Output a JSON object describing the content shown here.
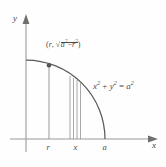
{
  "figure": {
    "type": "math-diagram",
    "background_color": "#fefefe",
    "stroke_color": "#4a4a4a",
    "axes": {
      "x_axis_label": "x",
      "y_axis_label": "y",
      "origin": {
        "x": 26,
        "y": 139
      }
    },
    "curve": {
      "equation_parts": {
        "x_var": "x",
        "y_var": "y",
        "a_var": "a",
        "exponent": "2",
        "plus": "+",
        "equals": "="
      },
      "equation_text": "x2 + y2 = a2",
      "radius_label": "a",
      "arc_start": {
        "x": 26,
        "y": 61
      },
      "arc_end": {
        "x": 105,
        "y": 139
      }
    },
    "point": {
      "marker": "filled-dot",
      "position": {
        "x": 49,
        "y": 65
      },
      "label_parts": {
        "open_paren": "(",
        "first_coord": "r",
        "comma": ",",
        "radical_symbol": "√",
        "under_a": "a",
        "minus": "−",
        "under_r": "r",
        "exponent": "2",
        "close_paren": ")"
      },
      "label_text": "(r, √(a2 − r2))"
    },
    "ticks": [
      {
        "label": "r",
        "x": 49
      },
      {
        "label": "x",
        "x": 76
      },
      {
        "label": "a",
        "x": 105
      }
    ],
    "strip": {
      "description": "narrow vertical rectangular strip of thin lines under the arc",
      "line_x_positions": [
        70,
        73.5,
        77,
        80.5
      ],
      "baseline_y": 139
    },
    "droplines": [
      {
        "from_x": 49,
        "from_y": 65,
        "to_y": 139,
        "name": "r-dropline"
      }
    ]
  }
}
